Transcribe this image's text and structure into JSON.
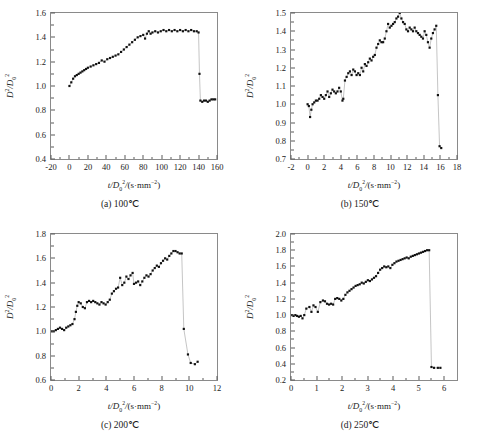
{
  "figure": {
    "marker_color": "#111111",
    "line_color": "#8a8a8a",
    "frame_color": "#8a8a8a",
    "background": "#ffffff"
  },
  "chart_data": [
    {
      "type": "scatter",
      "panel_id": "a",
      "caption": "(a) 100℃",
      "title": "",
      "xlabel": "t/D₀²/(s·mm⁻²)",
      "ylabel": "D²/D₀²",
      "xlim": [
        -20,
        160
      ],
      "ylim": [
        0.4,
        1.6
      ],
      "xticks": [
        -20,
        0,
        20,
        40,
        60,
        80,
        100,
        120,
        140,
        160
      ],
      "yticks": [
        0.4,
        0.6,
        0.8,
        1.0,
        1.2,
        1.4,
        1.6
      ],
      "xtick_labels": [
        "-20",
        "0",
        "20",
        "40",
        "60",
        "80",
        "100",
        "120",
        "140",
        "160"
      ],
      "ytick_labels": [
        "0.4",
        "0.6",
        "0.8",
        "1.0",
        "1.2",
        "1.4",
        "1.6"
      ],
      "grid": false,
      "legend": "none",
      "x": [
        0,
        2,
        4,
        6,
        8,
        10,
        12,
        14,
        16,
        18,
        20,
        23,
        26,
        29,
        32,
        35,
        38,
        41,
        44,
        47,
        50,
        53,
        56,
        59,
        62,
        65,
        68,
        71,
        74,
        77,
        80,
        82,
        84,
        86,
        88,
        90,
        93,
        96,
        99,
        102,
        105,
        108,
        111,
        114,
        117,
        120,
        123,
        126,
        129,
        132,
        135,
        138,
        140,
        141,
        142,
        144,
        146,
        148,
        150,
        152,
        154,
        156,
        158
      ],
      "y": [
        1.0,
        1.03,
        1.06,
        1.08,
        1.09,
        1.1,
        1.11,
        1.12,
        1.13,
        1.14,
        1.15,
        1.16,
        1.17,
        1.18,
        1.19,
        1.21,
        1.2,
        1.22,
        1.23,
        1.24,
        1.25,
        1.26,
        1.28,
        1.3,
        1.32,
        1.34,
        1.36,
        1.38,
        1.4,
        1.41,
        1.42,
        1.39,
        1.43,
        1.45,
        1.43,
        1.44,
        1.45,
        1.44,
        1.45,
        1.46,
        1.45,
        1.46,
        1.45,
        1.46,
        1.45,
        1.46,
        1.45,
        1.46,
        1.45,
        1.46,
        1.45,
        1.45,
        1.44,
        1.1,
        0.88,
        0.87,
        0.88,
        0.88,
        0.87,
        0.88,
        0.89,
        0.89,
        0.89
      ]
    },
    {
      "type": "scatter",
      "panel_id": "b",
      "caption": "(b) 150℃",
      "title": "",
      "xlabel": "t/D₀²/(s·mm⁻²)",
      "ylabel": "D²/D₀²",
      "xlim": [
        -2,
        18
      ],
      "ylim": [
        0.7,
        1.5
      ],
      "xticks": [
        -2,
        0,
        2,
        4,
        6,
        8,
        10,
        12,
        14,
        16,
        18
      ],
      "yticks": [
        0.7,
        0.8,
        0.9,
        1.0,
        1.1,
        1.2,
        1.3,
        1.4,
        1.5
      ],
      "xtick_labels": [
        "-2",
        "0",
        "2",
        "4",
        "6",
        "8",
        "10",
        "12",
        "14",
        "16",
        "18"
      ],
      "ytick_labels": [
        "0.7",
        "0.8",
        "0.9",
        "1.0",
        "1.1",
        "1.2",
        "1.3",
        "1.4",
        "1.5"
      ],
      "grid": false,
      "legend": "none",
      "x": [
        0.0,
        0.15,
        0.3,
        0.45,
        0.6,
        0.8,
        1.0,
        1.2,
        1.4,
        1.6,
        1.8,
        2.0,
        2.2,
        2.4,
        2.6,
        2.8,
        3.0,
        3.2,
        3.4,
        3.6,
        3.8,
        4.0,
        4.2,
        4.3,
        4.5,
        4.7,
        4.9,
        5.1,
        5.3,
        5.5,
        5.7,
        5.9,
        6.1,
        6.3,
        6.5,
        6.7,
        6.9,
        7.1,
        7.3,
        7.5,
        7.7,
        7.9,
        8.1,
        8.3,
        8.5,
        8.7,
        8.9,
        9.1,
        9.3,
        9.5,
        9.7,
        9.9,
        10.1,
        10.3,
        10.5,
        10.7,
        10.9,
        11.1,
        11.3,
        11.5,
        11.7,
        11.9,
        12.1,
        12.3,
        12.5,
        12.7,
        12.9,
        13.1,
        13.3,
        13.5,
        13.7,
        13.9,
        14.1,
        14.3,
        14.5,
        14.7,
        14.9,
        15.1,
        15.3,
        15.5,
        15.7,
        15.9,
        16.1
      ],
      "y": [
        1.0,
        0.99,
        0.93,
        0.97,
        1.0,
        1.01,
        1.02,
        1.02,
        1.03,
        1.05,
        1.04,
        1.03,
        1.05,
        1.07,
        1.04,
        1.06,
        1.08,
        1.07,
        1.06,
        1.07,
        1.09,
        1.07,
        1.02,
        1.03,
        1.13,
        1.15,
        1.17,
        1.18,
        1.16,
        1.19,
        1.18,
        1.16,
        1.17,
        1.16,
        1.2,
        1.18,
        1.22,
        1.21,
        1.23,
        1.25,
        1.24,
        1.26,
        1.27,
        1.31,
        1.33,
        1.35,
        1.34,
        1.34,
        1.36,
        1.4,
        1.44,
        1.42,
        1.43,
        1.44,
        1.45,
        1.47,
        1.48,
        1.5,
        1.47,
        1.45,
        1.44,
        1.41,
        1.4,
        1.42,
        1.41,
        1.4,
        1.42,
        1.4,
        1.39,
        1.38,
        1.37,
        1.36,
        1.4,
        1.38,
        1.34,
        1.31,
        1.36,
        1.39,
        1.41,
        1.43,
        1.05,
        0.77,
        0.76
      ]
    },
    {
      "type": "scatter",
      "panel_id": "c",
      "caption": "(c) 200℃",
      "title": "",
      "xlabel": "t/D₀²/(s·mm⁻²)",
      "ylabel": "D²/D₀²",
      "xlim": [
        0,
        12
      ],
      "ylim": [
        0.6,
        1.8
      ],
      "xticks": [
        0,
        2,
        4,
        6,
        8,
        10,
        12
      ],
      "yticks": [
        0.6,
        0.8,
        1.0,
        1.2,
        1.4,
        1.6,
        1.8
      ],
      "xtick_labels": [
        "0",
        "2",
        "4",
        "6",
        "8",
        "10",
        "12"
      ],
      "ytick_labels": [
        "0.6",
        "0.8",
        "1.0",
        "1.2",
        "1.4",
        "1.6",
        "1.8"
      ],
      "grid": false,
      "legend": "none",
      "x": [
        0.05,
        0.2,
        0.35,
        0.5,
        0.65,
        0.8,
        0.95,
        1.1,
        1.25,
        1.4,
        1.55,
        1.7,
        1.8,
        1.9,
        2.0,
        2.15,
        2.3,
        2.45,
        2.6,
        2.75,
        2.9,
        3.05,
        3.2,
        3.35,
        3.5,
        3.65,
        3.8,
        3.95,
        4.1,
        4.25,
        4.4,
        4.55,
        4.7,
        4.85,
        5.0,
        5.15,
        5.3,
        5.45,
        5.6,
        5.75,
        5.9,
        6.0,
        6.15,
        6.3,
        6.45,
        6.6,
        6.75,
        6.9,
        7.05,
        7.2,
        7.35,
        7.5,
        7.65,
        7.8,
        7.95,
        8.1,
        8.25,
        8.4,
        8.55,
        8.7,
        8.85,
        9.0,
        9.15,
        9.3,
        9.45,
        9.6,
        9.9,
        10.1,
        10.4,
        10.6
      ],
      "y": [
        1.0,
        1.0,
        1.01,
        1.02,
        1.03,
        1.02,
        1.01,
        1.03,
        1.04,
        1.05,
        1.06,
        1.1,
        1.16,
        1.21,
        1.24,
        1.23,
        1.2,
        1.19,
        1.24,
        1.25,
        1.24,
        1.25,
        1.24,
        1.23,
        1.22,
        1.24,
        1.23,
        1.22,
        1.24,
        1.26,
        1.31,
        1.33,
        1.35,
        1.36,
        1.44,
        1.38,
        1.4,
        1.45,
        1.43,
        1.46,
        1.48,
        1.39,
        1.4,
        1.41,
        1.38,
        1.41,
        1.44,
        1.46,
        1.45,
        1.47,
        1.5,
        1.52,
        1.54,
        1.53,
        1.56,
        1.58,
        1.6,
        1.59,
        1.62,
        1.64,
        1.66,
        1.66,
        1.65,
        1.64,
        1.64,
        1.02,
        0.81,
        0.74,
        0.73,
        0.75
      ]
    },
    {
      "type": "scatter",
      "panel_id": "d",
      "caption": "(d) 250℃",
      "title": "",
      "xlabel": "t/D₀²/(s·mm⁻²)",
      "ylabel": "D²/D₀²",
      "xlim": [
        0,
        6.5
      ],
      "ylim": [
        0.2,
        2.0
      ],
      "xticks": [
        0,
        1,
        2,
        3,
        4,
        5,
        6
      ],
      "yticks": [
        0.2,
        0.4,
        0.6,
        0.8,
        1.0,
        1.2,
        1.4,
        1.6,
        1.8,
        2.0
      ],
      "xtick_labels": [
        "0",
        "1",
        "2",
        "3",
        "4",
        "5",
        "6"
      ],
      "ytick_labels": [
        "0.2",
        "0.4",
        "0.6",
        "0.8",
        "1.0",
        "1.2",
        "1.4",
        "1.6",
        "1.8",
        "2.0"
      ],
      "grid": false,
      "legend": "none",
      "x": [
        0.03,
        0.1,
        0.17,
        0.24,
        0.31,
        0.38,
        0.45,
        0.52,
        0.6,
        0.72,
        0.8,
        0.88,
        0.96,
        1.05,
        1.15,
        1.25,
        1.33,
        1.41,
        1.49,
        1.57,
        1.65,
        1.73,
        1.81,
        1.89,
        1.97,
        2.05,
        2.13,
        2.21,
        2.29,
        2.37,
        2.45,
        2.53,
        2.61,
        2.69,
        2.77,
        2.85,
        2.93,
        3.01,
        3.09,
        3.17,
        3.25,
        3.33,
        3.41,
        3.49,
        3.57,
        3.65,
        3.73,
        3.81,
        3.89,
        3.97,
        4.05,
        4.13,
        4.21,
        4.29,
        4.37,
        4.45,
        4.53,
        4.61,
        4.69,
        4.77,
        4.85,
        4.93,
        5.01,
        5.09,
        5.17,
        5.25,
        5.33,
        5.41,
        5.5,
        5.6,
        5.75,
        5.85
      ],
      "y": [
        1.0,
        0.99,
        1.0,
        0.99,
        0.98,
        0.99,
        0.96,
        1.0,
        1.08,
        1.1,
        1.04,
        1.12,
        1.1,
        1.04,
        1.16,
        1.18,
        1.17,
        1.14,
        1.13,
        1.14,
        1.13,
        1.2,
        1.21,
        1.2,
        1.18,
        1.2,
        1.25,
        1.28,
        1.3,
        1.32,
        1.34,
        1.36,
        1.37,
        1.38,
        1.4,
        1.39,
        1.41,
        1.43,
        1.42,
        1.44,
        1.46,
        1.48,
        1.52,
        1.56,
        1.58,
        1.6,
        1.59,
        1.6,
        1.58,
        1.62,
        1.64,
        1.66,
        1.67,
        1.68,
        1.69,
        1.7,
        1.71,
        1.7,
        1.72,
        1.73,
        1.74,
        1.75,
        1.76,
        1.77,
        1.78,
        1.79,
        1.8,
        1.8,
        0.36,
        0.35,
        0.35,
        0.35
      ]
    }
  ]
}
